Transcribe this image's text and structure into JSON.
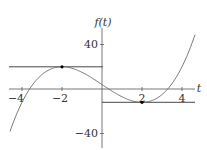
{
  "chart_data": {
    "type": "line",
    "title": "",
    "xlabel": "t",
    "ylabel": "f(t)",
    "xlim": [
      -4.6,
      4.65
    ],
    "ylim": [
      -50,
      52
    ],
    "x_ticks": [
      -4,
      -2,
      2,
      4
    ],
    "x_tick_labels": [
      "−4",
      "−2",
      "2",
      "4"
    ],
    "y_ticks": [
      40,
      -40
    ],
    "y_tick_labels": [
      "40",
      "−40"
    ],
    "grid": false,
    "legend": null,
    "series": [
      {
        "name": "f(t) = t^3 - 12t + 4",
        "type": "curve",
        "coeffs": [
          1,
          0,
          -12,
          4
        ],
        "t_range": [
          -4.6,
          4.65
        ]
      }
    ],
    "horizontal_lines": [
      {
        "y": 20,
        "t_range": [
          -4.6,
          0
        ]
      },
      {
        "y": -12,
        "t_range": [
          0,
          4.65
        ]
      }
    ],
    "points": [
      {
        "t": -2,
        "y": 20,
        "label": "local max"
      },
      {
        "t": 2,
        "y": -12,
        "label": "local min"
      }
    ]
  },
  "labels": {
    "y_axis": "f(t)",
    "x_axis": "t",
    "tick_40": "40",
    "tick_m40": "−40",
    "tick_m4": "−4",
    "tick_m2": "−2",
    "tick_2": "2",
    "tick_4": "4"
  }
}
